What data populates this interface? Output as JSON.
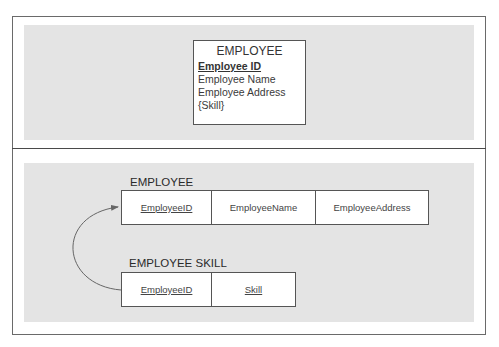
{
  "top_panel": {
    "entity": {
      "title": "EMPLOYEE",
      "primary_key": "Employee ID",
      "attributes": [
        "Employee Name",
        "Employee Address",
        "{Skill}"
      ]
    }
  },
  "bottom_panel": {
    "tables": [
      {
        "label": "EMPLOYEE",
        "columns": [
          {
            "name": "EmployeeID",
            "key": true
          },
          {
            "name": "EmployeeName",
            "key": false
          },
          {
            "name": "EmployeeAddress",
            "key": false
          }
        ]
      },
      {
        "label": "EMPLOYEE SKILL",
        "columns": [
          {
            "name": "EmployeeID",
            "key": true
          },
          {
            "name": "Skill",
            "key": true
          }
        ]
      }
    ],
    "relationship": {
      "from": "EMPLOYEE SKILL.EmployeeID",
      "to": "EMPLOYEE.EmployeeID"
    }
  },
  "colors": {
    "band": "#e4e4e4",
    "border": "#555555"
  }
}
